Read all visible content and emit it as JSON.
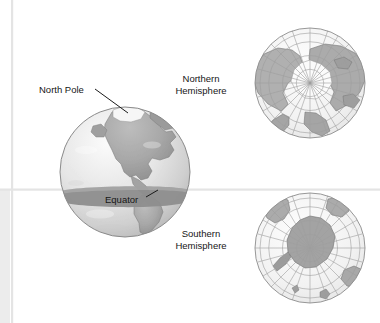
{
  "figure": {
    "background_color": "#ffffff",
    "width": 380,
    "height": 323
  },
  "guides": {
    "vertical_rule_color": "#e2e2e2",
    "horizontal_rule_color": "#e2e2e2",
    "left_panel_color": "#ececec"
  },
  "labels": {
    "north_pole": "North Pole",
    "equator": "Equator",
    "northern_hemisphere_line1": "Northern",
    "northern_hemisphere_line2": "Hemisphere",
    "southern_hemisphere_line1": "Southern",
    "southern_hemisphere_line2": "Hemisphere"
  },
  "colors": {
    "ocean_light": "#efefef",
    "ocean_mid": "#dcdcdc",
    "land": "#a9a9a9",
    "land_dark": "#9a9a9a",
    "equator_band": "#8e8e8e",
    "graticule": "#9d9d9d",
    "outline": "#6e6e6e",
    "ice": "#f4f4f4",
    "text": "#161616",
    "leader_line": "#1a1a1a"
  },
  "globe_main": {
    "name": "earth-globe-perspective",
    "center_x": 125,
    "center_y": 172,
    "radius": 65,
    "equator_band_y": 196,
    "equator_band_thickness": 17,
    "visible_region": "Americas"
  },
  "globe_northern": {
    "name": "northern-hemisphere-polar-map",
    "center_x": 310,
    "center_y": 83,
    "radius": 55,
    "pole": "North Pole",
    "graticule_meridians": 12,
    "graticule_parallels": 4
  },
  "globe_southern": {
    "name": "southern-hemisphere-polar-map",
    "center_x": 310,
    "center_y": 248,
    "radius": 55,
    "pole": "South Pole",
    "graticule_meridians": 12,
    "graticule_parallels": 4
  }
}
